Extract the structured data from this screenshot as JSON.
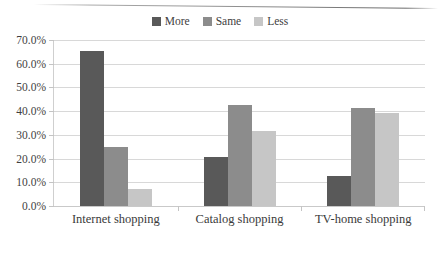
{
  "chart_data": {
    "type": "bar",
    "title": "",
    "subtitle": "",
    "xlabel": "",
    "ylabel": "",
    "categories": [
      "Internet shopping",
      "Catalog shopping",
      "TV-home shopping"
    ],
    "series": [
      {
        "name": "More",
        "color": "#595959",
        "values": [
          65.5,
          20.8,
          12.5
        ]
      },
      {
        "name": "Same",
        "color": "#8c8c8c",
        "values": [
          24.8,
          42.5,
          41.2
        ]
      },
      {
        "name": "Less",
        "color": "#c6c6c6",
        "values": [
          7.0,
          31.8,
          39.2
        ]
      }
    ],
    "ylim": [
      0,
      70
    ],
    "ytick_values": [
      70,
      60,
      50,
      40,
      30,
      20,
      10,
      0
    ],
    "ytick_labels": [
      "70.0%",
      "60.0%",
      "50.0%",
      "40.0%",
      "30.0%",
      "20.0%",
      "10.0%",
      "0.0%"
    ],
    "grid": true,
    "legend_position": "top-center",
    "legend_entries": [
      "More",
      "Same",
      "Less"
    ]
  }
}
